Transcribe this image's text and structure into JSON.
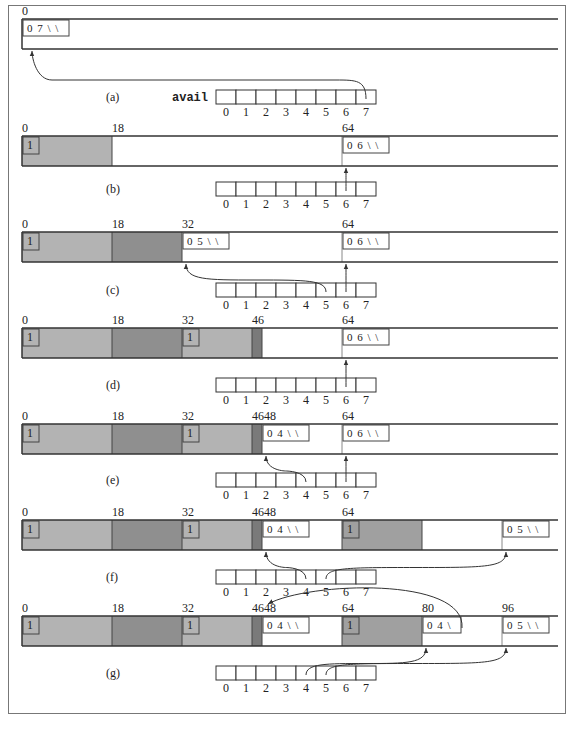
{
  "figure": {
    "array_name": "avail",
    "array_indices": [
      "0",
      "1",
      "2",
      "3",
      "4",
      "5",
      "6",
      "7"
    ],
    "colors": {
      "allocated_light": "#b3b3b3",
      "allocated_dark": "#8f8f8f",
      "allocated_darker": "#7a7a7a",
      "free": "#ffffff",
      "line": "#333333",
      "frame": "#777777"
    },
    "panels": [
      {
        "label": "(a)",
        "show_array_name": true,
        "tick_labels": [
          {
            "pos": 0,
            "text": "0"
          }
        ],
        "blocks": [
          {
            "start": 0,
            "end": 111,
            "status": "free",
            "header": "0 7 \\ \\"
          }
        ],
        "pointers": [
          {
            "from_index": 7,
            "to_pos": 0
          }
        ]
      },
      {
        "label": "(b)",
        "show_array_name": false,
        "tick_labels": [
          {
            "pos": 0,
            "text": "0"
          },
          {
            "pos": 18,
            "text": "18"
          },
          {
            "pos": 64,
            "text": "64"
          }
        ],
        "blocks": [
          {
            "start": 0,
            "end": 18,
            "status": "allocated",
            "shade": "light",
            "header": "1"
          },
          {
            "start": 18,
            "end": 64,
            "status": "free",
            "header": ""
          },
          {
            "start": 64,
            "end": 111,
            "status": "free",
            "header": "0 6 \\ \\"
          }
        ],
        "pointers": [
          {
            "from_index": 6,
            "to_pos": 64
          }
        ]
      },
      {
        "label": "(c)",
        "show_array_name": false,
        "tick_labels": [
          {
            "pos": 0,
            "text": "0"
          },
          {
            "pos": 18,
            "text": "18"
          },
          {
            "pos": 32,
            "text": "32"
          },
          {
            "pos": 64,
            "text": "64"
          }
        ],
        "blocks": [
          {
            "start": 0,
            "end": 18,
            "status": "allocated",
            "shade": "light",
            "header": "1"
          },
          {
            "start": 18,
            "end": 32,
            "status": "allocated",
            "shade": "dark",
            "header": ""
          },
          {
            "start": 32,
            "end": 64,
            "status": "free",
            "header": "0 5 \\ \\"
          },
          {
            "start": 64,
            "end": 111,
            "status": "free",
            "header": "0 6 \\ \\"
          }
        ],
        "pointers": [
          {
            "from_index": 5,
            "to_pos": 32
          },
          {
            "from_index": 6,
            "to_pos": 64
          }
        ]
      },
      {
        "label": "(d)",
        "show_array_name": false,
        "tick_labels": [
          {
            "pos": 0,
            "text": "0"
          },
          {
            "pos": 18,
            "text": "18"
          },
          {
            "pos": 32,
            "text": "32"
          },
          {
            "pos": 46,
            "text": "46"
          },
          {
            "pos": 64,
            "text": "64"
          }
        ],
        "blocks": [
          {
            "start": 0,
            "end": 18,
            "status": "allocated",
            "shade": "light",
            "header": "1"
          },
          {
            "start": 18,
            "end": 32,
            "status": "allocated",
            "shade": "dark",
            "header": ""
          },
          {
            "start": 32,
            "end": 46,
            "status": "allocated",
            "shade": "light",
            "header": "1"
          },
          {
            "start": 46,
            "end": 48,
            "status": "allocated",
            "shade": "darker",
            "header": ""
          },
          {
            "start": 48,
            "end": 64,
            "status": "free",
            "header": ""
          },
          {
            "start": 64,
            "end": 111,
            "status": "free",
            "header": "0 6 \\ \\"
          }
        ],
        "pointers": [
          {
            "from_index": 6,
            "to_pos": 64
          }
        ]
      },
      {
        "label": "(e)",
        "show_array_name": false,
        "tick_labels": [
          {
            "pos": 0,
            "text": "0"
          },
          {
            "pos": 18,
            "text": "18"
          },
          {
            "pos": 32,
            "text": "32"
          },
          {
            "pos": 46,
            "text": "4648"
          },
          {
            "pos": 64,
            "text": "64"
          }
        ],
        "blocks": [
          {
            "start": 0,
            "end": 18,
            "status": "allocated",
            "shade": "light",
            "header": "1"
          },
          {
            "start": 18,
            "end": 32,
            "status": "allocated",
            "shade": "dark",
            "header": ""
          },
          {
            "start": 32,
            "end": 46,
            "status": "allocated",
            "shade": "light",
            "header": "1"
          },
          {
            "start": 46,
            "end": 48,
            "status": "allocated",
            "shade": "darker",
            "header": ""
          },
          {
            "start": 48,
            "end": 64,
            "status": "free",
            "header": "0 4 \\ \\"
          },
          {
            "start": 64,
            "end": 111,
            "status": "free",
            "header": "0 6 \\ \\"
          }
        ],
        "pointers": [
          {
            "from_index": 4,
            "to_pos": 48
          },
          {
            "from_index": 6,
            "to_pos": 64
          }
        ]
      },
      {
        "label": "(f)",
        "show_array_name": false,
        "tick_labels": [
          {
            "pos": 0,
            "text": "0"
          },
          {
            "pos": 18,
            "text": "18"
          },
          {
            "pos": 32,
            "text": "32"
          },
          {
            "pos": 46,
            "text": "4648"
          },
          {
            "pos": 64,
            "text": "64"
          }
        ],
        "blocks": [
          {
            "start": 0,
            "end": 18,
            "status": "allocated",
            "shade": "light",
            "header": "1"
          },
          {
            "start": 18,
            "end": 32,
            "status": "allocated",
            "shade": "dark",
            "header": ""
          },
          {
            "start": 32,
            "end": 46,
            "status": "allocated",
            "shade": "light",
            "header": "1"
          },
          {
            "start": 46,
            "end": 48,
            "status": "allocated",
            "shade": "darker",
            "header": ""
          },
          {
            "start": 48,
            "end": 64,
            "status": "free",
            "header": "0 4 \\ \\"
          },
          {
            "start": 64,
            "end": 80,
            "status": "allocated",
            "shade": "mid",
            "header": "1"
          },
          {
            "start": 80,
            "end": 96,
            "status": "free",
            "header": ""
          },
          {
            "start": 96,
            "end": 111,
            "status": "free",
            "header": "0 5 \\ \\"
          }
        ],
        "pointers": [
          {
            "from_index": 4,
            "to_pos": 48
          },
          {
            "from_index": 5,
            "to_pos": 96
          }
        ]
      },
      {
        "label": "(g)",
        "show_array_name": false,
        "tick_labels": [
          {
            "pos": 0,
            "text": "0"
          },
          {
            "pos": 18,
            "text": "18"
          },
          {
            "pos": 32,
            "text": "32"
          },
          {
            "pos": 46,
            "text": "4648"
          },
          {
            "pos": 64,
            "text": "64"
          },
          {
            "pos": 80,
            "text": "80"
          },
          {
            "pos": 96,
            "text": "96"
          }
        ],
        "blocks": [
          {
            "start": 0,
            "end": 18,
            "status": "allocated",
            "shade": "light",
            "header": "1"
          },
          {
            "start": 18,
            "end": 32,
            "status": "allocated",
            "shade": "dark",
            "header": ""
          },
          {
            "start": 32,
            "end": 46,
            "status": "allocated",
            "shade": "light",
            "header": "1"
          },
          {
            "start": 46,
            "end": 48,
            "status": "allocated",
            "shade": "darker",
            "header": ""
          },
          {
            "start": 48,
            "end": 64,
            "status": "free",
            "header": "0 4 \\ \\"
          },
          {
            "start": 64,
            "end": 80,
            "status": "allocated",
            "shade": "mid",
            "header": "1"
          },
          {
            "start": 80,
            "end": 96,
            "status": "free",
            "header": "0 4 \\"
          },
          {
            "start": 96,
            "end": 111,
            "status": "free",
            "header": "0 5 \\ \\"
          }
        ],
        "pointers": [
          {
            "from_index": 4,
            "to_pos": 80
          },
          {
            "from_index": 5,
            "to_pos": 96
          },
          {
            "from_block_pos": 80,
            "to_pos": 48
          }
        ]
      }
    ]
  }
}
